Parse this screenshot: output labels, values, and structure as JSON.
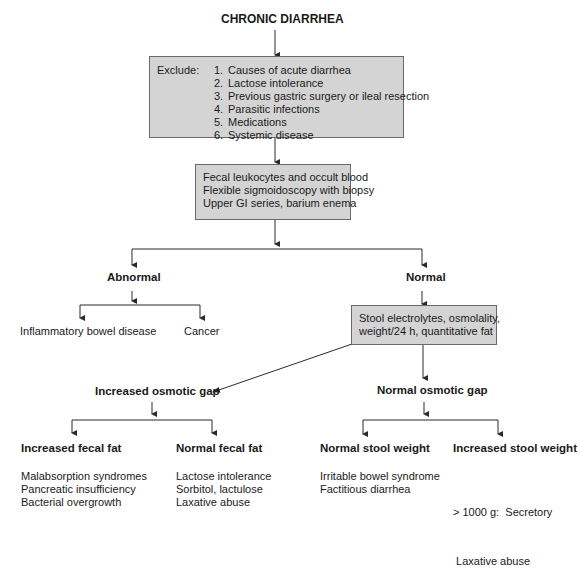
{
  "title": "CHRONIC DIARRHEA",
  "exclude_box": {
    "label": "Exclude:",
    "items": [
      {
        "num": "1.",
        "text": "Causes of acute diarrhea"
      },
      {
        "num": "2.",
        "text": "Lactose intolerance"
      },
      {
        "num": "3.",
        "text": "Previous gastric surgery or ileal resection"
      },
      {
        "num": "4.",
        "text": "Parasitic infections"
      },
      {
        "num": "5.",
        "text": "Medications"
      },
      {
        "num": "6.",
        "text": "Systemic disease"
      }
    ]
  },
  "tests_box": {
    "lines": [
      "Fecal leukocytes and occult blood",
      "Flexible sigmoidoscopy with biopsy",
      "Upper GI series, barium enema"
    ]
  },
  "abnormal": {
    "label": "Abnormal",
    "outcomes": [
      "Inflammatory bowel disease",
      "Cancer"
    ]
  },
  "normal": {
    "label": "Normal",
    "stool_box": {
      "lines": [
        "Stool electrolytes, osmolality,",
        "weight/24 h, quantitative fat"
      ]
    }
  },
  "increased_gap": {
    "label": "Increased osmotic gap",
    "branches": [
      {
        "label": "Increased fecal fat",
        "items": [
          "Malabsorption syndromes",
          "Pancreatic insufficiency",
          "Bacterial overgrowth"
        ]
      },
      {
        "label": "Normal fecal fat",
        "items": [
          "Lactose intolerance",
          "Sorbitol, lactulose",
          "Laxative abuse"
        ]
      }
    ]
  },
  "normal_gap": {
    "label": "Normal osmotic gap",
    "branches": [
      {
        "label": "Normal stool weight",
        "items": [
          "Irritable bowel syndrome",
          "Factitious diarrhea"
        ]
      },
      {
        "label": "Increased stool weight",
        "items": [
          "> 1000 g:  Secretory",
          " Laxative abuse"
        ]
      }
    ]
  },
  "colors": {
    "box_fill": "#d4d4d4",
    "box_border": "#6a6a6a",
    "line": "#2a2a2a"
  }
}
